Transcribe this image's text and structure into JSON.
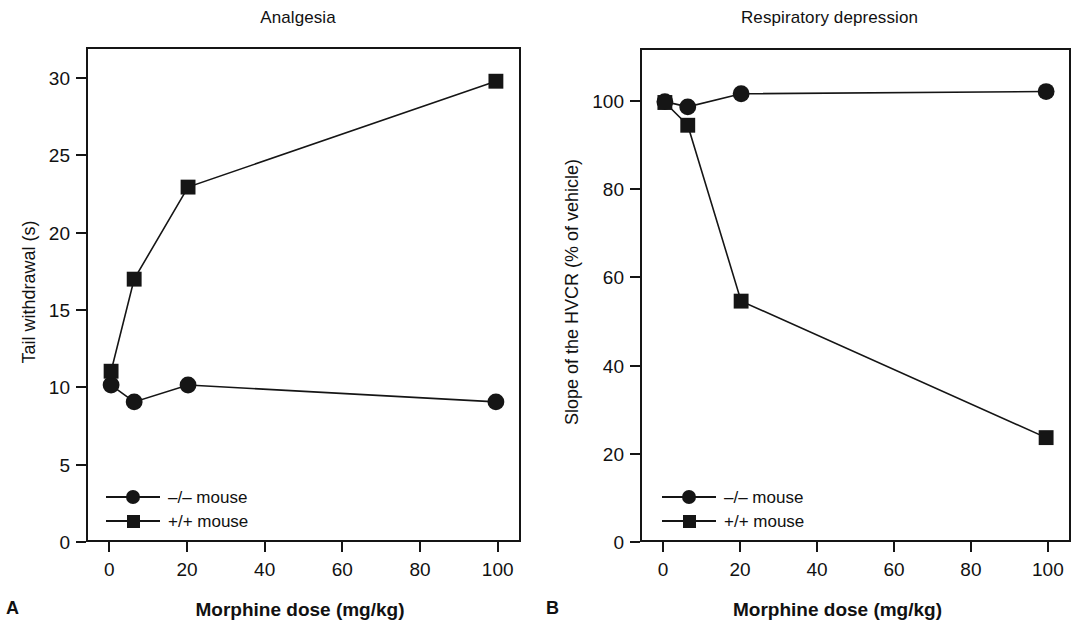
{
  "figure": {
    "background": "#ffffff",
    "ink_color": "#151515"
  },
  "panels": [
    {
      "letter": "A",
      "title": "Analgesia",
      "xlabel": "Morphine dose (mg/kg)",
      "ylabel": "Tail withdrawal (s)"
    },
    {
      "letter": "B",
      "title": "Respiratory depression",
      "xlabel": "Morphine dose (mg/kg)",
      "ylabel": "Slope of the HVCR (% of vehicle)"
    }
  ],
  "legend": {
    "entries": [
      {
        "label": "–/– mouse",
        "marker": "circle"
      },
      {
        "label": "+/+ mouse",
        "marker": "square"
      }
    ]
  },
  "chart_data": [
    {
      "type": "line",
      "panel": "A",
      "title": "Analgesia",
      "xlabel": "Morphine dose (mg/kg)",
      "ylabel": "Tail withdrawal (s)",
      "x": [
        0,
        6,
        20,
        100
      ],
      "xlim": [
        -6,
        106
      ],
      "ylim": [
        0,
        32
      ],
      "xticks": [
        0,
        20,
        40,
        60,
        80,
        100
      ],
      "yticks": [
        0,
        5,
        10,
        15,
        20,
        25,
        30
      ],
      "xticklabels": [
        "0",
        "20",
        "40",
        "60",
        "80",
        "100"
      ],
      "yticklabels": [
        "0",
        "5",
        "10",
        "15",
        "20",
        "25",
        "30"
      ],
      "grid": false,
      "legend_position": "lower left",
      "series": [
        {
          "name": "–/– mouse",
          "marker": "circle",
          "values": [
            10.1,
            9.0,
            10.1,
            9.0
          ]
        },
        {
          "name": "+/+ mouse",
          "marker": "square",
          "values": [
            11.0,
            17.0,
            23.0,
            29.9
          ]
        }
      ]
    },
    {
      "type": "line",
      "panel": "B",
      "title": "Respiratory depression",
      "xlabel": "Morphine dose (mg/kg)",
      "ylabel": "Slope of the HVCR (% of vehicle)",
      "x": [
        0,
        6,
        20,
        100
      ],
      "xlim": [
        -6,
        106
      ],
      "ylim": [
        0,
        112
      ],
      "xticks": [
        0,
        20,
        40,
        60,
        80,
        100
      ],
      "yticks": [
        0,
        20,
        40,
        60,
        80,
        100
      ],
      "xticklabels": [
        "0",
        "20",
        "40",
        "60",
        "80",
        "100"
      ],
      "yticklabels": [
        "0",
        "20",
        "40",
        "60",
        "80",
        "100"
      ],
      "grid": false,
      "legend_position": "lower left",
      "series": [
        {
          "name": "–/– mouse",
          "marker": "circle",
          "values": [
            100.2,
            99.0,
            102.0,
            102.5
          ]
        },
        {
          "name": "+/+ mouse",
          "marker": "square",
          "values": [
            100.0,
            94.8,
            54.6,
            23.4
          ]
        }
      ]
    }
  ]
}
